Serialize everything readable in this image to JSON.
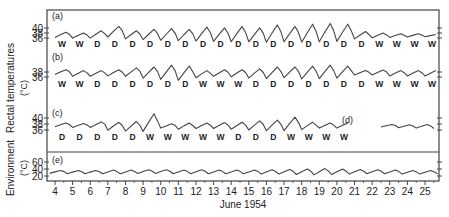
{
  "chart_data": {
    "type": "line",
    "title": "",
    "xlabel": "June 1954",
    "x_ticks": [
      "4",
      "5",
      "6",
      "7",
      "8",
      "9",
      "10",
      "11",
      "12",
      "13",
      "14",
      "15",
      "16",
      "17",
      "18",
      "19",
      "20",
      "21",
      "22",
      "23",
      "24",
      "25"
    ],
    "xlim": [
      3.7,
      25.9
    ],
    "left_axis_group_labels": [
      {
        "text": "Rectal temperatures",
        "unit": "(°C)"
      },
      {
        "text": "Environment",
        "unit": "(°C)"
      }
    ],
    "panels": [
      {
        "id": "a",
        "label": "(a)",
        "yticks": [
          "40",
          "38",
          "36"
        ],
        "ylim": [
          35,
          41
        ],
        "series": [
          {
            "name": "rectal temperature (a)",
            "x_start": 4.0,
            "x_end": 25.7,
            "day_min": [
              36.8,
              36.6,
              36.6,
              36.9,
              36.4,
              36.2,
              36.0,
              35.9,
              35.8,
              35.7,
              35.6,
              35.6,
              35.5,
              35.6,
              35.5,
              35.6,
              35.7,
              36.4,
              36.7,
              36.8,
              36.9,
              37.0
            ],
            "day_max": [
              38.2,
              38.0,
              38.6,
              39.8,
              38.6,
              39.0,
              39.2,
              39.0,
              39.6,
              39.4,
              39.8,
              39.4,
              40.2,
              39.8,
              40.4,
              40.6,
              40.4,
              38.4,
              38.0,
              37.8,
              37.8,
              37.6
            ]
          }
        ],
        "day_labels": [
          "W",
          "W",
          "D",
          "D",
          "D",
          "D",
          "D",
          "D",
          "D",
          "D",
          "D",
          "D",
          "D",
          "D",
          "D",
          "D",
          "D",
          "D",
          "W",
          "W",
          "W",
          "W"
        ]
      },
      {
        "id": "b",
        "label": "(b)",
        "yticks": [
          "38",
          "36"
        ],
        "ylim": [
          35,
          39.5
        ],
        "series": [
          {
            "name": "rectal temperature (b)",
            "x_start": 4.0,
            "x_end": 25.7,
            "day_min": [
              36.9,
              36.5,
              36.5,
              36.6,
              36.5,
              36.1,
              35.8,
              35.6,
              36.2,
              36.5,
              36.4,
              36.1,
              36.0,
              36.2,
              35.9,
              36.0,
              36.1,
              36.8,
              36.8,
              36.6,
              36.6,
              36.6
            ],
            "day_max": [
              38.0,
              37.8,
              37.8,
              38.0,
              38.4,
              38.6,
              39.0,
              38.8,
              37.8,
              38.0,
              38.0,
              38.2,
              38.6,
              38.6,
              38.8,
              39.0,
              38.8,
              37.8,
              37.9,
              37.8,
              37.8,
              37.8
            ]
          }
        ],
        "day_labels": [
          "W",
          "W",
          "D",
          "D",
          "D",
          "D",
          "D",
          "D",
          "W",
          "W",
          "W",
          "D",
          "D",
          "D",
          "D",
          "D",
          "D",
          "D",
          "W",
          "W",
          "W",
          "W"
        ]
      },
      {
        "id": "c",
        "label": "(c)",
        "yticks": [
          "40",
          "38",
          "36"
        ],
        "ylim": [
          35,
          41
        ],
        "series": [
          {
            "name": "rectal temperature (c)",
            "x_start": 4.0,
            "x_end": 20.7,
            "day_min": [
              37.0,
              36.8,
              36.8,
              36.0,
              35.8,
              35.7,
              36.6,
              36.3,
              36.5,
              36.5,
              36.3,
              36.1,
              35.9,
              35.9,
              36.2,
              36.6,
              36.6
            ],
            "day_max": [
              38.0,
              37.9,
              38.3,
              38.2,
              38.4,
              40.5,
              37.8,
              38.0,
              38.0,
              38.1,
              38.2,
              38.6,
              38.8,
              39.6,
              38.2,
              38.0,
              38.0
            ]
          }
        ],
        "day_labels": [
          "D",
          "D",
          "D",
          "D",
          "D",
          "W",
          "W",
          "W",
          "W",
          "W",
          "D",
          "D",
          "D",
          "W",
          "W",
          "W",
          "W"
        ]
      },
      {
        "id": "d",
        "label": "(d)",
        "yticks": [],
        "ylim": [
          35,
          41
        ],
        "series": [
          {
            "name": "rectal temperature (d)",
            "x_start": 22.5,
            "x_end": 25.7,
            "day_min": [
              36.9,
              36.7,
              36.6,
              36.5
            ],
            "day_max": [
              37.6,
              37.5,
              37.6,
              37.5
            ]
          }
        ],
        "day_labels": []
      },
      {
        "id": "e",
        "label": "(e)",
        "yticks": [
          "60",
          "40",
          "20"
        ],
        "ylim": [
          10,
          70
        ],
        "series": [
          {
            "name": "environment temperature",
            "x_start": 3.7,
            "x_end": 25.8,
            "day_min": [
              28,
              27,
              27,
              27,
              27,
              28,
              28,
              27,
              27,
              27,
              27,
              27,
              26,
              26,
              25,
              24,
              25,
              26,
              27,
              27,
              26,
              26,
              27
            ],
            "day_max": [
              36,
              36,
              36,
              37,
              37,
              38,
              38,
              37,
              38,
              37,
              37,
              37,
              38,
              39,
              40,
              41,
              40,
              39,
              38,
              37,
              36,
              36,
              36
            ]
          }
        ],
        "day_labels": []
      }
    ],
    "annotations": [
      "W = wet (sweating/wetted) day",
      "D = dry day"
    ],
    "grid": false,
    "legend": "none"
  }
}
